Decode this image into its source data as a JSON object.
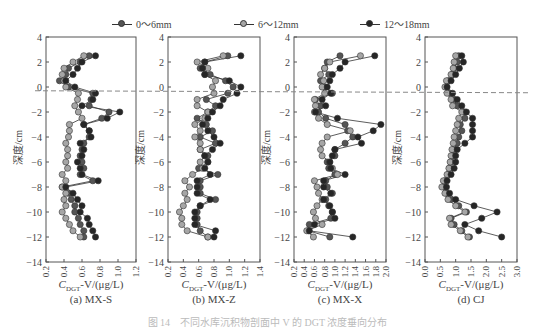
{
  "legend": [
    {
      "label": "0～6mm",
      "color": "#555555"
    },
    {
      "label": "6～12mm",
      "color": "#a6a6a6"
    },
    {
      "label": "12～18mm",
      "color": "#262626"
    }
  ],
  "y_axis_label": "深度/cm",
  "x_axis_label_main": "C",
  "x_axis_label_sub": "DGT",
  "x_axis_label_tail": "-V/(μg/L)",
  "caption": "图 14　不同水库沉积物剖面中 V 的 DGT 浓度垂向分布",
  "swi_depth": -0.3,
  "chart_data": [
    {
      "type": "line",
      "title": "(a) MX-S",
      "xlabel": "C_DGT-V/(μg/L)",
      "ylabel": "深度/cm",
      "xlim": [
        0.2,
        1.2
      ],
      "xticks": [
        "0.2",
        "0.4",
        "0.6",
        "0.8",
        "1.0",
        "1.2"
      ],
      "ylim": [
        -14,
        4
      ],
      "yticks": [
        "4",
        "2",
        "0",
        "-2",
        "-4",
        "-6",
        "-8",
        "-10",
        "-12",
        "-14"
      ],
      "grid": false,
      "legend_position": "top",
      "depth": [
        2.5,
        2,
        1.5,
        1,
        0.5,
        0,
        -0.5,
        -1,
        -1.5,
        -2,
        -2.5,
        -3,
        -3.5,
        -4,
        -4.5,
        -5,
        -5.5,
        -6,
        -6.5,
        -7,
        -7.5,
        -8,
        -8.5,
        -9,
        -9.5,
        -10,
        -10.5,
        -11,
        -11.5,
        -12
      ],
      "series": [
        {
          "name": "0～6mm",
          "values": [
            0.68,
            0.58,
            0.45,
            0.42,
            0.35,
            0.45,
            0.72,
            0.7,
            0.68,
            0.9,
            0.82,
            0.62,
            0.68,
            0.68,
            0.62,
            0.6,
            0.58,
            0.6,
            0.62,
            0.58,
            0.72,
            0.38,
            0.45,
            0.48,
            0.52,
            0.52,
            0.56,
            0.58,
            0.62,
            0.62
          ]
        },
        {
          "name": "6～12mm",
          "values": [
            0.62,
            0.5,
            0.4,
            0.38,
            0.4,
            0.42,
            0.56,
            0.55,
            0.52,
            0.56,
            0.6,
            0.46,
            0.46,
            0.45,
            0.42,
            0.44,
            0.44,
            0.42,
            0.44,
            0.38,
            0.42,
            0.38,
            0.42,
            0.4,
            0.42,
            0.38,
            0.42,
            0.46,
            0.5,
            0.58
          ]
        },
        {
          "name": "12～18mm",
          "values": [
            0.75,
            0.6,
            0.55,
            0.5,
            0.42,
            0.52,
            0.75,
            0.72,
            0.6,
            1.02,
            0.88,
            0.62,
            0.68,
            0.7,
            0.58,
            0.62,
            0.6,
            0.55,
            0.58,
            0.6,
            0.78,
            0.42,
            0.5,
            0.55,
            0.6,
            0.58,
            0.66,
            0.68,
            0.72,
            0.75
          ]
        }
      ]
    },
    {
      "type": "line",
      "title": "(b) MX-Z",
      "xlabel": "C_DGT-V/(μg/L)",
      "ylabel": "深度/cm",
      "xlim": [
        0.2,
        1.4
      ],
      "xticks": [
        "0.2",
        "0.4",
        "0.6",
        "0.8",
        "1.0",
        "1.2",
        "1.4"
      ],
      "ylim": [
        -14,
        4
      ],
      "yticks": [
        "4",
        "2",
        "0",
        "-2",
        "-4",
        "-6",
        "-8",
        "-10",
        "-12",
        "-14"
      ],
      "grid": false,
      "legend_position": "top",
      "depth": [
        2.5,
        2,
        1.5,
        1,
        0.5,
        0,
        -0.5,
        -1,
        -1.5,
        -2,
        -2.5,
        -3,
        -3.5,
        -4,
        -4.5,
        -5,
        -5.5,
        -6,
        -6.5,
        -7,
        -7.5,
        -8,
        -8.5,
        -9,
        -9.5,
        -10,
        -10.5,
        -11,
        -11.5,
        -12
      ],
      "series": [
        {
          "name": "0～6mm",
          "values": [
            0.98,
            0.68,
            0.62,
            0.75,
            0.95,
            1.05,
            0.98,
            0.7,
            0.82,
            0.72,
            0.58,
            0.7,
            0.78,
            0.62,
            0.82,
            0.62,
            0.72,
            0.72,
            0.6,
            0.85,
            0.62,
            0.62,
            0.62,
            0.82,
            0.62,
            0.58,
            0.58,
            0.58,
            0.62,
            0.72
          ]
        },
        {
          "name": "6～12mm",
          "values": [
            0.92,
            0.58,
            0.72,
            0.68,
            0.82,
            0.78,
            0.8,
            0.58,
            0.58,
            0.72,
            0.68,
            0.55,
            0.62,
            0.55,
            0.62,
            0.62,
            0.68,
            0.62,
            0.65,
            0.52,
            0.42,
            0.48,
            0.42,
            0.45,
            0.4,
            0.35,
            0.38,
            0.38,
            0.45,
            0.72
          ]
        },
        {
          "name": "12～18mm",
          "values": [
            1.15,
            0.68,
            0.65,
            0.68,
            1.0,
            1.15,
            1.1,
            0.92,
            0.88,
            0.78,
            0.72,
            0.65,
            0.72,
            0.8,
            0.88,
            0.78,
            0.68,
            0.72,
            0.68,
            0.75,
            0.58,
            0.58,
            0.58,
            0.75,
            0.62,
            0.55,
            0.55,
            0.55,
            0.82,
            0.8
          ]
        }
      ]
    },
    {
      "type": "line",
      "title": "(c) MX-X",
      "xlabel": "C_DGT-V/(μg/L)",
      "ylabel": "深度/cm",
      "xlim": [
        0.2,
        2.0
      ],
      "xticks": [
        "0.2",
        "0.4",
        "0.6",
        "0.8",
        "1.0",
        "1.2",
        "1.4",
        "1.6",
        "1.8",
        "2.0"
      ],
      "ylim": [
        -14,
        4
      ],
      "yticks": [
        "4",
        "2",
        "0",
        "-2",
        "-4",
        "-6",
        "-8",
        "-10",
        "-12",
        "-14"
      ],
      "grid": false,
      "legend_position": "top",
      "depth": [
        2.5,
        2,
        1.5,
        1,
        0.5,
        0,
        -0.5,
        -1,
        -1.5,
        -2,
        -2.5,
        -3,
        -3.5,
        -4,
        -4.5,
        -5,
        -5.5,
        -6,
        -6.5,
        -7,
        -7.5,
        -8,
        -8.5,
        -9,
        -9.5,
        -10,
        -10.5,
        -11,
        -11.5,
        -12
      ],
      "series": [
        {
          "name": "0～6mm",
          "values": [
            1.1,
            0.85,
            0.8,
            0.88,
            0.72,
            0.8,
            0.95,
            0.62,
            0.72,
            0.68,
            0.82,
            1.2,
            1.25,
            1.35,
            1.2,
            1.0,
            1.0,
            0.85,
            0.88,
            1.0,
            0.82,
            0.85,
            0.95,
            0.82,
            0.88,
            0.95,
            0.92,
            0.5,
            0.48,
            0.9
          ]
        },
        {
          "name": "6～12mm",
          "values": [
            1.5,
            0.9,
            0.8,
            0.72,
            0.78,
            0.75,
            0.8,
            0.6,
            0.62,
            0.6,
            0.68,
            0.85,
            1.3,
            0.85,
            0.75,
            0.72,
            0.75,
            0.9,
            0.95,
            1.05,
            0.6,
            0.65,
            0.68,
            0.75,
            0.65,
            0.58,
            0.62,
            0.75,
            0.45,
            0.58
          ]
        },
        {
          "name": "12～18mm",
          "values": [
            1.78,
            1.2,
            1.1,
            0.95,
            0.9,
            0.85,
            0.92,
            0.75,
            0.82,
            0.62,
            1.05,
            1.9,
            1.75,
            1.45,
            1.52,
            1.0,
            0.95,
            0.9,
            0.92,
            1.2,
            0.78,
            0.78,
            0.92,
            0.78,
            0.9,
            0.95,
            1.0,
            0.6,
            0.5,
            1.35
          ]
        }
      ]
    },
    {
      "type": "line",
      "title": "(d) CJ",
      "xlabel": "C_DGT-V/(μg/L)",
      "ylabel": "深度/cm",
      "xlim": [
        0.0,
        3.0
      ],
      "xticks": [
        "0.0",
        "0.5",
        "1.0",
        "1.5",
        "2.0",
        "2.5",
        "3.0"
      ],
      "ylim": [
        -14,
        4
      ],
      "yticks": [
        "4",
        "2",
        "0",
        "-2",
        "-4",
        "-6",
        "-8",
        "-10",
        "-12",
        "-14"
      ],
      "grid": false,
      "legend_position": "top",
      "depth": [
        2.5,
        2,
        1.5,
        1,
        0.5,
        0,
        -0.5,
        -1,
        -1.5,
        -2,
        -2.5,
        -3,
        -3.5,
        -4,
        -4.5,
        -5,
        -5.5,
        -6,
        -6.5,
        -7,
        -7.5,
        -8,
        -8.5,
        -9,
        -9.5,
        -10,
        -10.5,
        -11,
        -11.5,
        -12
      ],
      "series": [
        {
          "name": "0～6mm",
          "values": [
            1.1,
            1.05,
            0.95,
            0.88,
            0.75,
            0.7,
            0.82,
            0.95,
            1.05,
            1.3,
            1.3,
            1.15,
            1.2,
            1.1,
            1.05,
            0.95,
            0.9,
            0.85,
            0.8,
            0.75,
            0.65,
            0.65,
            0.7,
            0.85,
            1.1,
            1.35,
            0.85,
            0.95,
            1.2,
            1.45
          ]
        },
        {
          "name": "6～12mm",
          "values": [
            1.0,
            0.95,
            0.92,
            0.85,
            0.7,
            0.65,
            0.72,
            0.85,
            0.9,
            1.2,
            1.1,
            1.05,
            1.0,
            0.95,
            0.92,
            0.88,
            0.85,
            0.82,
            0.78,
            0.72,
            0.6,
            0.55,
            0.65,
            0.75,
            1.0,
            1.3,
            0.8,
            0.85,
            1.15,
            1.4
          ]
        },
        {
          "name": "12～18mm",
          "values": [
            1.2,
            1.25,
            1.12,
            1.0,
            0.85,
            0.72,
            0.9,
            1.05,
            1.2,
            1.35,
            1.55,
            1.55,
            1.55,
            1.55,
            1.3,
            1.05,
            1.0,
            1.0,
            0.95,
            0.85,
            0.72,
            0.7,
            0.8,
            1.0,
            1.6,
            2.35,
            1.85,
            1.3,
            1.75,
            2.5
          ]
        }
      ]
    }
  ]
}
